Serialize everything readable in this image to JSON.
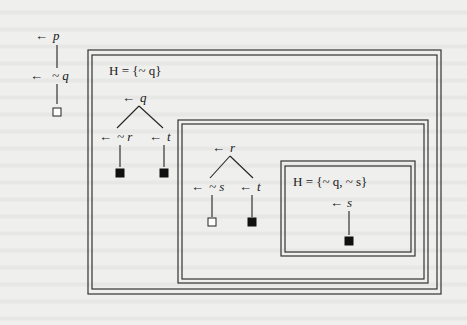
{
  "diagram": {
    "type": "nested-tableaux",
    "trees": [
      {
        "id": "tree-1",
        "nodes": [
          {
            "label": "p",
            "arrow": "←"
          },
          {
            "label": "~ q",
            "arrow": "←"
          }
        ],
        "leaves": [
          "open"
        ]
      },
      {
        "id": "tree-2",
        "hypothesis": "H = {~ q}",
        "root": {
          "label": "q",
          "arrow": "←"
        },
        "children": [
          {
            "label": "~ r",
            "arrow": "←",
            "leaf": "closed"
          },
          {
            "label": "t",
            "arrow": "←",
            "leaf": "closed"
          }
        ]
      },
      {
        "id": "tree-3",
        "root": {
          "label": "r",
          "arrow": "←"
        },
        "children": [
          {
            "label": "~ s",
            "arrow": "←",
            "leaf": "open"
          },
          {
            "label": "t",
            "arrow": "←",
            "leaf": "closed"
          }
        ]
      },
      {
        "id": "tree-4",
        "hypothesis": "H = {~ q, ~ s}",
        "root": {
          "label": "s",
          "arrow": "←",
          "leaf": "closed"
        }
      }
    ],
    "legend": {
      "open_leaf": "hollow square",
      "closed_leaf": "filled square"
    }
  }
}
